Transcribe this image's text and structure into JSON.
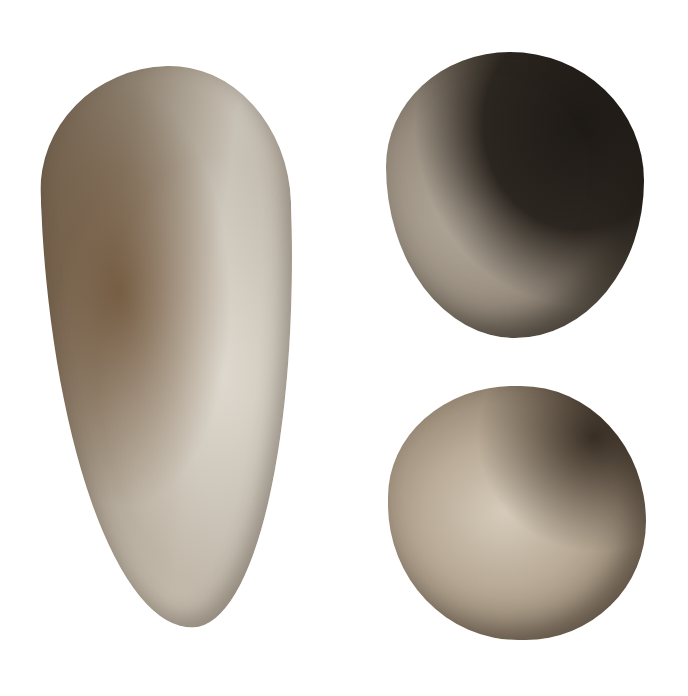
{
  "scene": {
    "description": "Photograph of three prehistoric stone tools on a white background",
    "objects": [
      {
        "id": "handaxe",
        "label": "Elongated flaked stone handaxe",
        "colors": [
          "#6b5a47",
          "#c9c2b6"
        ]
      },
      {
        "id": "spheroid-top",
        "label": "Rounded stone spheroid with dark patina and ink catalogue marks",
        "colors": [
          "#978c7e",
          "#2c2620"
        ]
      },
      {
        "id": "spheroid-bottom",
        "label": "Rounded pale stone spheroid",
        "colors": [
          "#d6cbbb",
          "#3a2f25"
        ]
      }
    ],
    "background": "#ffffff"
  }
}
